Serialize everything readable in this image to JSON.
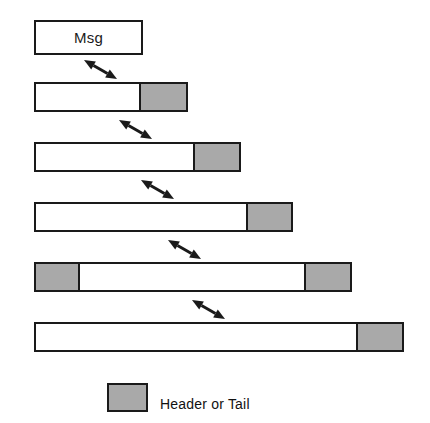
{
  "figure": {
    "name": "message-encapsulation-diagram",
    "canvas": {
      "width": 430,
      "height": 423
    },
    "colors": {
      "background": "#ffffff",
      "outline": "#1a1a1a",
      "header_fill": "#a9a9a9",
      "payload_fill": "#ffffff",
      "text": "#111111"
    }
  },
  "bars": [
    {
      "id": "msg",
      "label": "Msg",
      "x": 34,
      "y": 20,
      "width": 109,
      "height": 35,
      "segments": []
    },
    {
      "id": "layer-1",
      "label": "",
      "x": 34,
      "y": 82,
      "width": 154,
      "height": 30,
      "segments": [
        {
          "side": "right",
          "width": 45,
          "fill": "header"
        }
      ]
    },
    {
      "id": "layer-2",
      "label": "",
      "x": 34,
      "y": 142,
      "width": 207,
      "height": 30,
      "segments": [
        {
          "side": "right",
          "width": 44,
          "fill": "header"
        }
      ]
    },
    {
      "id": "layer-3",
      "label": "",
      "x": 34,
      "y": 202,
      "width": 259,
      "height": 30,
      "segments": [
        {
          "side": "right",
          "width": 43,
          "fill": "header"
        }
      ]
    },
    {
      "id": "layer-4",
      "label": "",
      "x": 34,
      "y": 262,
      "width": 318,
      "height": 30,
      "segments": [
        {
          "side": "left",
          "width": 42,
          "fill": "header"
        },
        {
          "side": "right",
          "width": 44,
          "fill": "header"
        }
      ]
    },
    {
      "id": "layer-5",
      "label": "",
      "x": 34,
      "y": 322,
      "width": 370,
      "height": 30,
      "segments": [
        {
          "side": "right",
          "width": 44,
          "fill": "header"
        }
      ]
    }
  ],
  "arrows": [
    {
      "id": "arrow-1",
      "from_bar": "msg",
      "to_bar": "layer-1",
      "x1": 84,
      "y1": 60,
      "x2": 117,
      "y2": 79
    },
    {
      "id": "arrow-2",
      "from_bar": "layer-1",
      "to_bar": "layer-2",
      "x1": 119,
      "y1": 120,
      "x2": 152,
      "y2": 139
    },
    {
      "id": "arrow-3",
      "from_bar": "layer-2",
      "to_bar": "layer-3",
      "x1": 141,
      "y1": 180,
      "x2": 174,
      "y2": 199
    },
    {
      "id": "arrow-4",
      "from_bar": "layer-3",
      "to_bar": "layer-4",
      "x1": 168,
      "y1": 240,
      "x2": 201,
      "y2": 259
    },
    {
      "id": "arrow-5",
      "from_bar": "layer-4",
      "to_bar": "layer-5",
      "x1": 192,
      "y1": 300,
      "x2": 225,
      "y2": 319
    }
  ],
  "legend": {
    "swatch": {
      "x": 107,
      "y": 383,
      "width": 41,
      "height": 29,
      "fill": "header"
    },
    "label": "Header or Tail",
    "label_x": 160,
    "label_y": 391
  }
}
